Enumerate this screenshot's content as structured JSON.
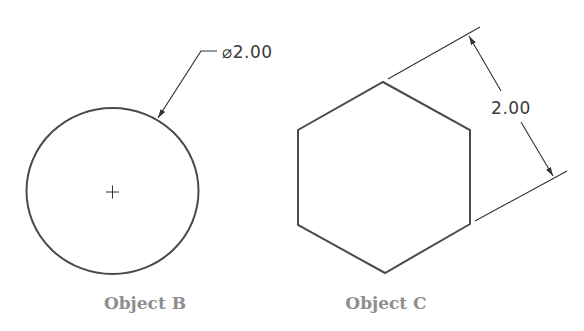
{
  "objects": [
    {
      "id": "B",
      "label": "Object B",
      "shape": "circle",
      "dimension": {
        "type": "diameter",
        "text": "⌀2.00"
      },
      "center_mark": "+"
    },
    {
      "id": "C",
      "label": "Object C",
      "shape": "hexagon",
      "dimension": {
        "type": "across-flats",
        "text": "2.00"
      }
    }
  ],
  "colors": {
    "line": "#4a4a4a",
    "dim_line": "#333333",
    "label": "#8e8e8e"
  }
}
